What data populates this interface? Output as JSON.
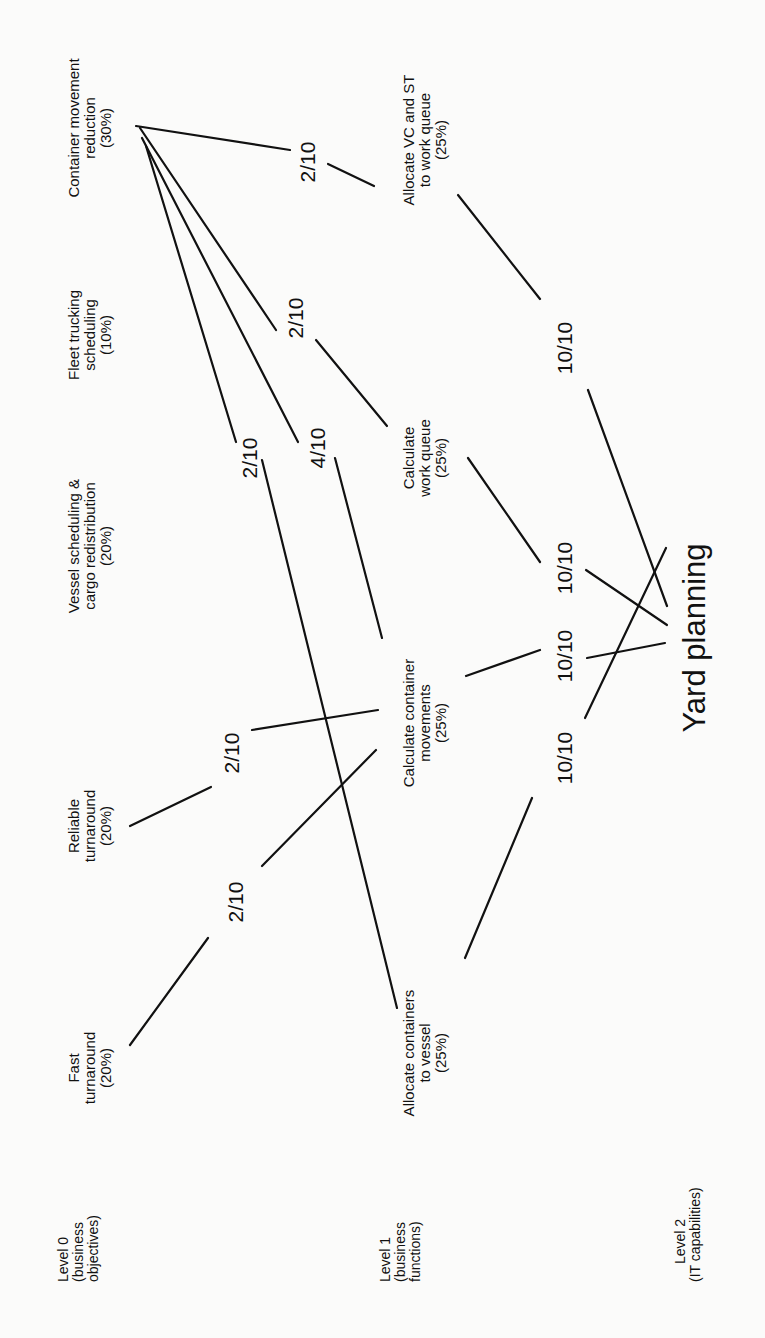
{
  "levels": [
    {
      "line1": "Level 0",
      "line2": "(business",
      "line3": "objectives)"
    },
    {
      "line1": "Level 1",
      "line2": "(business",
      "line3": "functions)"
    },
    {
      "line1": "Level 2",
      "line2": "(IT capabilities)",
      "line3": ""
    }
  ],
  "level0": [
    {
      "id": "fast",
      "line1": "Fast",
      "line2": "turnaround",
      "pct": "(20%)"
    },
    {
      "id": "reliable",
      "line1": "Reliable",
      "line2": "turnaround",
      "pct": "(20%)"
    },
    {
      "id": "vessel",
      "line1": "Vessel scheduling &",
      "line2": "cargo redistribution",
      "pct": "(20%)"
    },
    {
      "id": "fleet",
      "line1": "Fleet trucking",
      "line2": "scheduling",
      "pct": "(10%)"
    },
    {
      "id": "cmr",
      "line1": "Container movement",
      "line2": "reduction",
      "pct": "(30%)"
    }
  ],
  "level1": [
    {
      "id": "acv",
      "line1": "Allocate containers",
      "line2": "to vessel",
      "pct": "(25%)"
    },
    {
      "id": "ccm",
      "line1": "Calculate container",
      "line2": "movements",
      "pct": "(25%)"
    },
    {
      "id": "cwq",
      "line1": "Calculate",
      "line2": "work queue",
      "pct": "(25%)"
    },
    {
      "id": "avs",
      "line1": "Allocate VC and ST",
      "line2": "to work queue",
      "pct": "(25%)"
    }
  ],
  "level2": {
    "label": "Yard planning"
  },
  "edges": [
    {
      "from": "fast",
      "to": "ccm",
      "weight": "2/10"
    },
    {
      "from": "reliable",
      "to": "ccm",
      "weight": "2/10"
    },
    {
      "from": "cmr",
      "to": "acv",
      "weight": "2/10"
    },
    {
      "from": "cmr",
      "to": "ccm",
      "weight": "4/10"
    },
    {
      "from": "cmr",
      "to": "cwq",
      "weight": "2/10"
    },
    {
      "from": "cmr",
      "to": "avs",
      "weight": "2/10"
    },
    {
      "from": "acv",
      "to": "yard",
      "weight": "10/10"
    },
    {
      "from": "ccm",
      "to": "yard",
      "weight": "10/10"
    },
    {
      "from": "cwq",
      "to": "yard",
      "weight": "10/10"
    },
    {
      "from": "avs",
      "to": "yard",
      "weight": "10/10"
    }
  ]
}
